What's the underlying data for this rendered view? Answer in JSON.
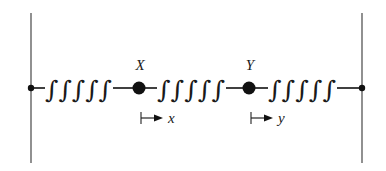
{
  "diagram": {
    "type": "coupled-spring-mass-system",
    "walls": [
      {
        "side": "left",
        "x": 31
      },
      {
        "side": "right",
        "x": 362
      }
    ],
    "springs": [
      {
        "id": "spring-1",
        "glyph": "∫∫∫∫∫",
        "from": "left-wall",
        "to": "mass-X"
      },
      {
        "id": "spring-2",
        "glyph": "∫∫∫∫∫",
        "from": "mass-X",
        "to": "mass-Y"
      },
      {
        "id": "spring-3",
        "glyph": "∫∫∫∫∫",
        "from": "mass-Y",
        "to": "right-wall"
      }
    ],
    "masses": [
      {
        "id": "mass-X",
        "label": "X",
        "displacement_label": "x"
      },
      {
        "id": "mass-Y",
        "label": "Y",
        "displacement_label": "y"
      }
    ],
    "colors": {
      "ink": "#1a1a1a",
      "wall": "#555555",
      "background": "#ffffff"
    }
  }
}
